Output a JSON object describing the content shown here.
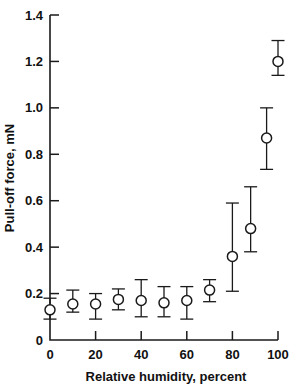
{
  "chart_data": {
    "type": "scatter",
    "title": "",
    "xlabel": "Relative humidity, percent",
    "ylabel": "Pull-off force, mN",
    "xlim": [
      0,
      100
    ],
    "ylim": [
      0,
      1.4
    ],
    "xticks": [
      0,
      20,
      40,
      60,
      80,
      100
    ],
    "xtick_labels": [
      "0",
      "20",
      "40",
      "60",
      "80",
      "100"
    ],
    "yticks": [
      0,
      0.2,
      0.4,
      0.6,
      0.8,
      1.0,
      1.2,
      1.4
    ],
    "ytick_labels": [
      "0",
      "0.2",
      "0.4",
      "0.6",
      "0.8",
      "1.0",
      "1.2",
      "1.4"
    ],
    "grid": false,
    "legend": null,
    "marker_style": "open-circle",
    "error_bars": "vertical",
    "x": [
      0,
      10,
      20,
      30,
      40,
      50,
      60,
      70,
      80,
      88,
      95,
      100
    ],
    "y": [
      0.13,
      0.155,
      0.155,
      0.175,
      0.17,
      0.16,
      0.17,
      0.215,
      0.36,
      0.48,
      0.87,
      1.2
    ],
    "y_err_low": [
      0.09,
      0.12,
      0.09,
      0.13,
      0.1,
      0.1,
      0.09,
      0.165,
      0.21,
      0.38,
      0.735,
      1.14
    ],
    "y_err_high": [
      0.18,
      0.215,
      0.2,
      0.22,
      0.26,
      0.23,
      0.23,
      0.26,
      0.59,
      0.66,
      1.0,
      1.29
    ],
    "series": [
      {
        "name": "Pull-off force",
        "points": [
          {
            "x": 0,
            "y": 0.13,
            "low": 0.09,
            "high": 0.18
          },
          {
            "x": 10,
            "y": 0.155,
            "low": 0.12,
            "high": 0.215
          },
          {
            "x": 20,
            "y": 0.155,
            "low": 0.09,
            "high": 0.2
          },
          {
            "x": 30,
            "y": 0.175,
            "low": 0.13,
            "high": 0.22
          },
          {
            "x": 40,
            "y": 0.17,
            "low": 0.1,
            "high": 0.26
          },
          {
            "x": 50,
            "y": 0.16,
            "low": 0.1,
            "high": 0.23
          },
          {
            "x": 60,
            "y": 0.17,
            "low": 0.09,
            "high": 0.23
          },
          {
            "x": 70,
            "y": 0.215,
            "low": 0.165,
            "high": 0.26
          },
          {
            "x": 80,
            "y": 0.36,
            "low": 0.21,
            "high": 0.59
          },
          {
            "x": 88,
            "y": 0.48,
            "low": 0.38,
            "high": 0.66
          },
          {
            "x": 95,
            "y": 0.87,
            "low": 0.735,
            "high": 1.0
          },
          {
            "x": 100,
            "y": 1.2,
            "low": 1.14,
            "high": 1.29
          }
        ]
      }
    ],
    "colors": {
      "axis": "#1a1a1a",
      "marker_fill": "#ffffff",
      "marker_edge": "#1a1a1a",
      "background": "#ffffff"
    }
  }
}
